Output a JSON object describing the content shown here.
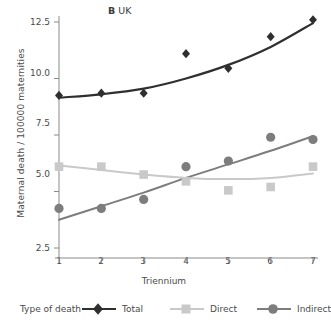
{
  "chart_data": {
    "type": "scatter",
    "title": "B UK",
    "title_prefix": "B",
    "title_text": "UK",
    "xlabel": "Triennium",
    "ylabel": "Maternal death / 100000 maternities",
    "x": [
      1,
      2,
      3,
      4,
      5,
      6,
      7
    ],
    "xticklabels": [
      "1",
      "2",
      "3",
      "4",
      "5",
      "6",
      "7"
    ],
    "yticklabels": [
      "2.5",
      "5.0",
      "7.5",
      "10.0",
      "12.5"
    ],
    "yticks": [
      2.5,
      5.0,
      7.5,
      10.0,
      12.5
    ],
    "xlim": [
      0.75,
      7.35
    ],
    "ylim": [
      2.2,
      13.0
    ],
    "grid": false,
    "legend_position": "bottom",
    "legend_title": "Type of death",
    "series": [
      {
        "name": "Total",
        "marker": "diamond",
        "color": "#2f2f2f",
        "values": [
          9.25,
          9.35,
          9.35,
          11.1,
          10.45,
          11.85,
          12.6
        ],
        "fit": [
          9.15,
          9.3,
          9.55,
          10.0,
          10.6,
          11.4,
          12.45
        ]
      },
      {
        "name": "Direct",
        "marker": "square",
        "color": "#c9c9c9",
        "values": [
          6.1,
          6.1,
          5.75,
          5.45,
          5.05,
          5.2,
          6.1
        ],
        "fit": [
          6.15,
          5.95,
          5.75,
          5.6,
          5.55,
          5.6,
          5.8
        ]
      },
      {
        "name": "Indirect",
        "marker": "circle",
        "color": "#7d7d7d",
        "values": [
          4.25,
          4.25,
          4.65,
          6.1,
          6.35,
          7.4,
          7.3
        ],
        "fit": [
          3.75,
          4.35,
          4.95,
          5.6,
          6.2,
          6.8,
          7.45
        ]
      }
    ]
  },
  "colors": {
    "total": "#2f2f2f",
    "direct": "#c9c9c9",
    "indirect": "#7d7d7d",
    "axis": "#8a8a8a",
    "text": "#4a4a4a",
    "background": "#ffffff"
  }
}
